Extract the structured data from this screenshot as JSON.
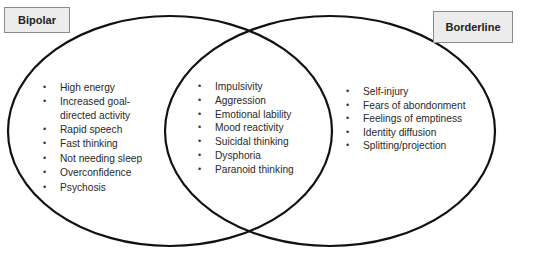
{
  "diagram": {
    "type": "venn",
    "sets": [
      {
        "label": "Bipolar",
        "unique_items": [
          "High energy",
          "Increased goal-directed activity",
          "Rapid speech",
          "Fast thinking",
          "Not needing sleep",
          "Overconfidence",
          "Psychosis"
        ]
      },
      {
        "label": "Borderline",
        "unique_items": [
          "Self-injury",
          "Fears of abondonment",
          "Feelings of emptiness",
          "Identity diffusion",
          "Splitting/projection"
        ]
      }
    ],
    "overlap_items": [
      "Impulsivity",
      "Aggression",
      "Emotional lability",
      "Mood reactivity",
      "Suicidal thinking",
      "Dysphoria",
      "Paranoid thinking"
    ],
    "colors": {
      "outline": "#111111",
      "label_box_fill": "#ececec",
      "label_box_border": "#8a8a8a"
    }
  }
}
